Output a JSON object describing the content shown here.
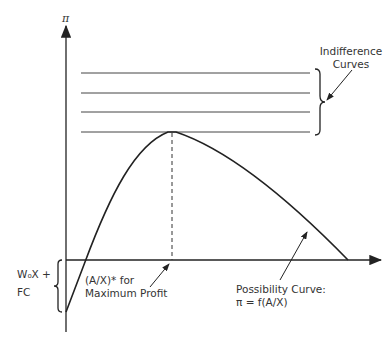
{
  "diagram": {
    "y_axis_label": "π",
    "indifference_label_line1": "Indifference",
    "indifference_label_line2": "Curves",
    "fixed_cost_label_line1": "W₀X +",
    "fixed_cost_label_line2": "FC",
    "optimum_label_line1": "(A/X)* for",
    "optimum_label_line2": "Maximum Profit",
    "possibility_label_line1": "Possibility Curve:",
    "possibility_label_line2": "π = f(A/X)",
    "colors": {
      "ink": "#222222",
      "background": "#ffffff"
    }
  }
}
